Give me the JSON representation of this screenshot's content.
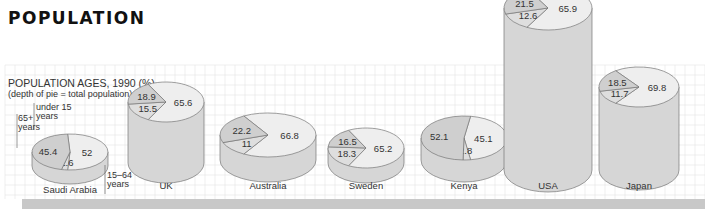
{
  "page_title": "POPULATION",
  "chart_data": {
    "type": "pie",
    "title": "POPULATION AGES, 1990 (%)",
    "subtitle": "(depth of pie = total population)",
    "legend_labels": {
      "under15": [
        "under 15",
        "years"
      ],
      "over65": [
        "65+",
        "years"
      ],
      "working": [
        "15–64",
        "years"
      ]
    },
    "series_keys": [
      "under 15",
      "15–64",
      "65+"
    ],
    "countries": [
      {
        "name": "Saudi Arabia",
        "under15": 45.4,
        "working": 52,
        "over65": 2.6,
        "depth": 1
      },
      {
        "name": "UK",
        "under15": 18.9,
        "working": 65.6,
        "over65": 15.5,
        "depth": 3
      },
      {
        "name": "Australia",
        "under15": 22.2,
        "working": 66.8,
        "over65": 11,
        "depth": 1.3
      },
      {
        "name": "Sweden",
        "under15": 16.5,
        "working": 65.2,
        "over65": 18.3,
        "depth": 0.7
      },
      {
        "name": "Kenya",
        "under15": 52.1,
        "working": 45.1,
        "over65": 2.8,
        "depth": 2
      },
      {
        "name": "USA",
        "under15": 21.5,
        "working": 65.9,
        "over65": 12.6,
        "depth": 20
      },
      {
        "name": "Japan",
        "under15": 18.5,
        "working": 69.8,
        "over65": 11.7,
        "depth": 9.8
      }
    ]
  },
  "colors": {
    "under15": "#cfcfcf",
    "working": "#eeeeee",
    "over65": "#dedede",
    "side": "#d6d6d6",
    "edge": "#777777",
    "grid": "#e4e4e4",
    "shadow": "#c8c8c8"
  }
}
